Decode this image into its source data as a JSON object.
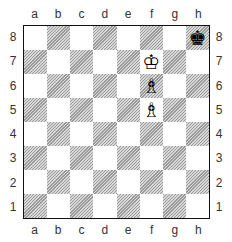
{
  "files": [
    "a",
    "b",
    "c",
    "d",
    "e",
    "f",
    "g",
    "h"
  ],
  "ranks": [
    "8",
    "7",
    "6",
    "5",
    "4",
    "3",
    "2",
    "1"
  ],
  "pieces": {
    "h8": {
      "glyph": "♚",
      "name": "black-king"
    },
    "f7": {
      "glyph": "♔",
      "name": "white-king"
    },
    "f6": {
      "glyph": "♗",
      "name": "white-bishop"
    },
    "f5": {
      "glyph": "♗",
      "name": "white-bishop"
    }
  },
  "colors": {
    "border": "#111111",
    "dark_square_hatch": "#9a9a9a",
    "light_square": "#ffffff"
  }
}
